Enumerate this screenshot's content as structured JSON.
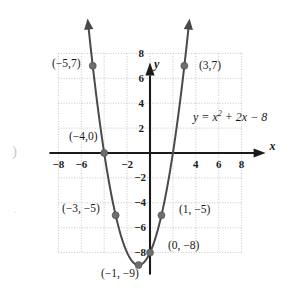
{
  "chart_data": {
    "type": "line",
    "title": "",
    "equation_label": "y = x² + 2x − 8",
    "equation_parts": {
      "lhs": "y",
      "eq": "=",
      "base": "x",
      "exp": "2",
      "rest": "+ 2x − 8"
    },
    "function": "y = x^2 + 2x - 8",
    "xlabel": "x",
    "ylabel": "y",
    "xlim": [
      -8,
      8
    ],
    "ylim": [
      -8,
      8
    ],
    "grid": true,
    "grid_step": 2,
    "x_ticks": [
      "−8",
      "−6",
      "−4",
      "−2",
      "2",
      "4",
      "6",
      "8"
    ],
    "x_tick_values": [
      -8,
      -6,
      -4,
      -2,
      2,
      4,
      6,
      8
    ],
    "x_tick_shown": [
      "−8",
      "−6",
      "",
      "−2",
      "",
      "4",
      "6",
      "8"
    ],
    "y_ticks": [
      "8",
      "6",
      "4",
      "2",
      "−2",
      "−4",
      "−6",
      "−8"
    ],
    "y_tick_values": [
      8,
      6,
      4,
      2,
      -2,
      -4,
      -6,
      -8
    ],
    "points": [
      {
        "label": "(−5,7)",
        "x": -5,
        "y": 7,
        "label_side": "left"
      },
      {
        "label": "(3,7)",
        "x": 3,
        "y": 7,
        "label_side": "right"
      },
      {
        "label": "(−4,0)",
        "x": -4,
        "y": 0,
        "label_side": "above-left"
      },
      {
        "label": "(−3, −5)",
        "x": -3,
        "y": -5,
        "label_side": "left"
      },
      {
        "label": "(1, −5)",
        "x": 1,
        "y": -5,
        "label_side": "right"
      },
      {
        "label": "(0, −8)",
        "x": 0,
        "y": -8,
        "label_side": "right"
      },
      {
        "label": "(−1, −9)",
        "x": -1,
        "y": -9,
        "label_side": "below"
      }
    ],
    "curve_domain": [
      -5.35,
      3.35
    ],
    "arrowheads": [
      "up-left",
      "up-right"
    ],
    "colors": {
      "curve": "#4a4a4a",
      "axis": "#1a1a1a",
      "grid": "#b9b9b9",
      "point": "#6e6e6e",
      "text": "#1a1a1a",
      "background": "#ffffff"
    }
  }
}
